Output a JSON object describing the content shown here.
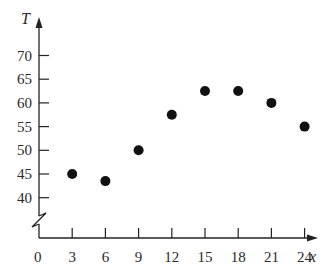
{
  "chart_data": {
    "type": "scatter",
    "title": "",
    "xlabel": "x",
    "ylabel": "T",
    "x": [
      3,
      6,
      9,
      12,
      15,
      18,
      21,
      24
    ],
    "series": [
      {
        "name": "T",
        "values": [
          45,
          43.5,
          50,
          57.5,
          62.5,
          62.5,
          60,
          55
        ]
      }
    ],
    "x_ticks": [
      0,
      3,
      6,
      9,
      12,
      15,
      18,
      21,
      24
    ],
    "y_ticks": [
      40,
      45,
      50,
      55,
      60,
      65,
      70
    ],
    "xlim": [
      0,
      26
    ],
    "ylim": [
      35,
      73
    ],
    "y_axis_break": true,
    "grid": false,
    "legend": null,
    "colors": {
      "points": "#111111",
      "axes": "#222222"
    }
  },
  "labels": {
    "y_axis": "T",
    "x_axis": "x",
    "x_origin": "0"
  }
}
